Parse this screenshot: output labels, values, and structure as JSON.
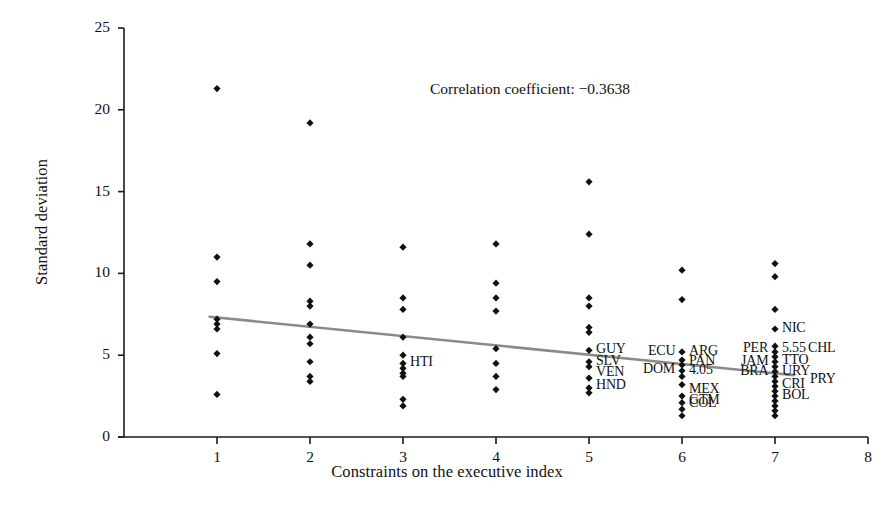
{
  "chart_data": {
    "type": "scatter",
    "title": "",
    "xlabel": "Constraints on the executive index",
    "ylabel": "Standard deviation",
    "xlim": [
      0,
      8
    ],
    "ylim": [
      0,
      25
    ],
    "xticks": [
      "1",
      "2",
      "3",
      "4",
      "5",
      "6",
      "7",
      "8"
    ],
    "yticks": [
      "0",
      "5",
      "10",
      "15",
      "20",
      "25"
    ],
    "grid": false,
    "legend": "none",
    "annotation": "Correlation coefficient: −0.3638",
    "correlation_coefficient": -0.3638,
    "trendline": {
      "type": "linear",
      "x_start": 0.92,
      "y_start": 7.35,
      "x_end": 7.2,
      "y_end": 3.78,
      "color": "#8a8a8a"
    },
    "points": [
      {
        "x": 1,
        "y": 21.3
      },
      {
        "x": 1,
        "y": 11.0
      },
      {
        "x": 1,
        "y": 9.5
      },
      {
        "x": 1,
        "y": 7.2
      },
      {
        "x": 1,
        "y": 6.9
      },
      {
        "x": 1,
        "y": 6.6
      },
      {
        "x": 1,
        "y": 5.1
      },
      {
        "x": 1,
        "y": 2.6
      },
      {
        "x": 2,
        "y": 19.2
      },
      {
        "x": 2,
        "y": 11.8
      },
      {
        "x": 2,
        "y": 10.5
      },
      {
        "x": 2,
        "y": 8.3
      },
      {
        "x": 2,
        "y": 8.0
      },
      {
        "x": 2,
        "y": 6.9
      },
      {
        "x": 2,
        "y": 6.1
      },
      {
        "x": 2,
        "y": 5.7
      },
      {
        "x": 2,
        "y": 4.6
      },
      {
        "x": 2,
        "y": 3.7
      },
      {
        "x": 2,
        "y": 3.4
      },
      {
        "x": 3,
        "y": 11.6
      },
      {
        "x": 3,
        "y": 8.5
      },
      {
        "x": 3,
        "y": 7.8
      },
      {
        "x": 3,
        "y": 6.1
      },
      {
        "x": 3,
        "y": 5.0
      },
      {
        "x": 3,
        "y": 4.5
      },
      {
        "x": 3,
        "y": 4.2
      },
      {
        "x": 3,
        "y": 3.9
      },
      {
        "x": 3,
        "y": 3.7
      },
      {
        "x": 3,
        "y": 2.3
      },
      {
        "x": 3,
        "y": 1.9
      },
      {
        "x": 4,
        "y": 11.8
      },
      {
        "x": 4,
        "y": 9.4
      },
      {
        "x": 4,
        "y": 8.5
      },
      {
        "x": 4,
        "y": 7.7
      },
      {
        "x": 4,
        "y": 5.4
      },
      {
        "x": 4,
        "y": 4.5
      },
      {
        "x": 4,
        "y": 3.7
      },
      {
        "x": 4,
        "y": 2.9
      },
      {
        "x": 5,
        "y": 15.6
      },
      {
        "x": 5,
        "y": 12.4
      },
      {
        "x": 5,
        "y": 8.5
      },
      {
        "x": 5,
        "y": 8.0
      },
      {
        "x": 5,
        "y": 6.7
      },
      {
        "x": 5,
        "y": 6.4
      },
      {
        "x": 5,
        "y": 5.3
      },
      {
        "x": 5,
        "y": 4.6
      },
      {
        "x": 5,
        "y": 4.3
      },
      {
        "x": 5,
        "y": 3.6
      },
      {
        "x": 5,
        "y": 3.0
      },
      {
        "x": 5,
        "y": 2.7
      },
      {
        "x": 6,
        "y": 10.2
      },
      {
        "x": 6,
        "y": 8.4
      },
      {
        "x": 6,
        "y": 5.2
      },
      {
        "x": 6,
        "y": 4.7
      },
      {
        "x": 6,
        "y": 4.4
      },
      {
        "x": 6,
        "y": 4.05
      },
      {
        "x": 6,
        "y": 3.7
      },
      {
        "x": 6,
        "y": 3.2
      },
      {
        "x": 6,
        "y": 2.5
      },
      {
        "x": 6,
        "y": 2.1
      },
      {
        "x": 6,
        "y": 1.7
      },
      {
        "x": 6,
        "y": 1.3
      },
      {
        "x": 7,
        "y": 10.6
      },
      {
        "x": 7,
        "y": 9.8
      },
      {
        "x": 7,
        "y": 7.8
      },
      {
        "x": 7,
        "y": 6.6
      },
      {
        "x": 7,
        "y": 5.55
      },
      {
        "x": 7,
        "y": 5.2
      },
      {
        "x": 7,
        "y": 4.9
      },
      {
        "x": 7,
        "y": 4.6
      },
      {
        "x": 7,
        "y": 4.3
      },
      {
        "x": 7,
        "y": 4.0
      },
      {
        "x": 7,
        "y": 3.7
      },
      {
        "x": 7,
        "y": 3.4
      },
      {
        "x": 7,
        "y": 3.1
      },
      {
        "x": 7,
        "y": 2.8
      },
      {
        "x": 7,
        "y": 2.5
      },
      {
        "x": 7,
        "y": 2.2
      },
      {
        "x": 7,
        "y": 1.9
      },
      {
        "x": 7,
        "y": 1.6
      },
      {
        "x": 7,
        "y": 1.3
      }
    ],
    "point_labels": [
      {
        "text": "HTI",
        "x": 3,
        "y": 4.5,
        "anchor": "left"
      },
      {
        "text": "GUY",
        "x": 5,
        "y": 5.3,
        "anchor": "left"
      },
      {
        "text": "SLV",
        "x": 5,
        "y": 4.6,
        "anchor": "left"
      },
      {
        "text": "VEN",
        "x": 5,
        "y": 3.9,
        "anchor": "left"
      },
      {
        "text": "HND",
        "x": 5,
        "y": 3.1,
        "anchor": "left"
      },
      {
        "text": "ECU",
        "x": 6,
        "y": 5.2,
        "anchor": "right"
      },
      {
        "text": "DOM",
        "x": 6,
        "y": 4.1,
        "anchor": "right"
      },
      {
        "text": "ARG",
        "x": 6,
        "y": 5.2,
        "anchor": "left"
      },
      {
        "text": "PAN",
        "x": 6,
        "y": 4.6,
        "anchor": "left"
      },
      {
        "text": "4.05",
        "x": 6,
        "y": 4.05,
        "anchor": "left"
      },
      {
        "text": "MEX",
        "x": 6,
        "y": 2.9,
        "anchor": "left"
      },
      {
        "text": "GTM",
        "x": 6,
        "y": 2.2,
        "anchor": "left"
      },
      {
        "text": "COL",
        "x": 6,
        "y": 2.0,
        "anchor": "left"
      },
      {
        "text": "BRA",
        "x": 6.55,
        "y": 3.95,
        "anchor": "left"
      },
      {
        "text": "NIC",
        "x": 7,
        "y": 6.6,
        "anchor": "left"
      },
      {
        "text": "PER",
        "x": 7,
        "y": 5.4,
        "anchor": "right"
      },
      {
        "text": "JAM",
        "x": 7,
        "y": 4.6,
        "anchor": "right"
      },
      {
        "text": "5.55",
        "x": 7,
        "y": 5.4,
        "anchor": "left"
      },
      {
        "text": "CHL",
        "x": 7.28,
        "y": 5.4,
        "anchor": "left"
      },
      {
        "text": "TTO",
        "x": 7,
        "y": 4.65,
        "anchor": "left"
      },
      {
        "text": "URY",
        "x": 7,
        "y": 3.95,
        "anchor": "left"
      },
      {
        "text": "PRY",
        "x": 7.3,
        "y": 3.5,
        "anchor": "left"
      },
      {
        "text": "CRI",
        "x": 7,
        "y": 3.2,
        "anchor": "left"
      },
      {
        "text": "BOL",
        "x": 7,
        "y": 2.5,
        "anchor": "left"
      }
    ]
  }
}
